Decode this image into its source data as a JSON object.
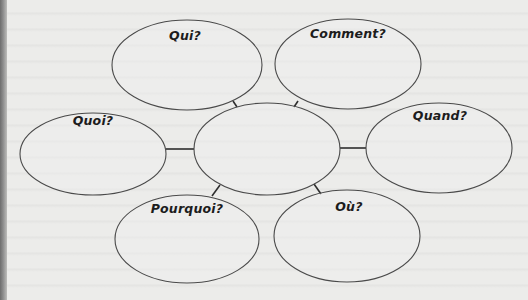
{
  "diagram": {
    "type": "mind-map",
    "center": {
      "id": "center",
      "label": "",
      "cx": 267,
      "cy": 149,
      "rx": 73,
      "ry": 46
    },
    "nodes": [
      {
        "id": "qui",
        "label": "Qui?",
        "cx": 187,
        "cy": 65,
        "rx": 75,
        "ry": 45,
        "label_x": 185,
        "label_y": 40
      },
      {
        "id": "comment",
        "label": "Comment?",
        "cx": 348,
        "cy": 64,
        "rx": 73,
        "ry": 45,
        "label_x": 348,
        "label_y": 38
      },
      {
        "id": "quoi",
        "label": "Quoi?",
        "cx": 93,
        "cy": 154,
        "rx": 73,
        "ry": 41,
        "label_x": 93,
        "label_y": 125
      },
      {
        "id": "quand",
        "label": "Quand?",
        "cx": 439,
        "cy": 148,
        "rx": 73,
        "ry": 45,
        "label_x": 440,
        "label_y": 120
      },
      {
        "id": "pourquoi",
        "label": "Pourquoi?",
        "cx": 187,
        "cy": 239,
        "rx": 72,
        "ry": 44,
        "label_x": 187,
        "label_y": 213
      },
      {
        "id": "ou",
        "label": "Où?",
        "cx": 347,
        "cy": 236,
        "rx": 73,
        "ry": 46,
        "label_x": 349,
        "label_y": 211
      }
    ],
    "connectors": [
      {
        "from": "qui",
        "x1": 233,
        "y1": 101,
        "x2": 237,
        "y2": 107
      },
      {
        "from": "comment",
        "x1": 298,
        "y1": 101,
        "x2": 294,
        "y2": 107
      },
      {
        "from": "quoi",
        "x1": 166,
        "y1": 149,
        "x2": 194,
        "y2": 149
      },
      {
        "from": "quand",
        "x1": 340,
        "y1": 148,
        "x2": 366,
        "y2": 148
      },
      {
        "from": "pourquoi",
        "x1": 220,
        "y1": 185,
        "x2": 212,
        "y2": 196
      },
      {
        "from": "ou",
        "x1": 314,
        "y1": 184,
        "x2": 321,
        "y2": 194
      }
    ]
  },
  "colors": {
    "paper": "#ececea",
    "stroke": "#4a4a4a",
    "text": "#1c1c1c",
    "spine": "#6d6d6d"
  }
}
